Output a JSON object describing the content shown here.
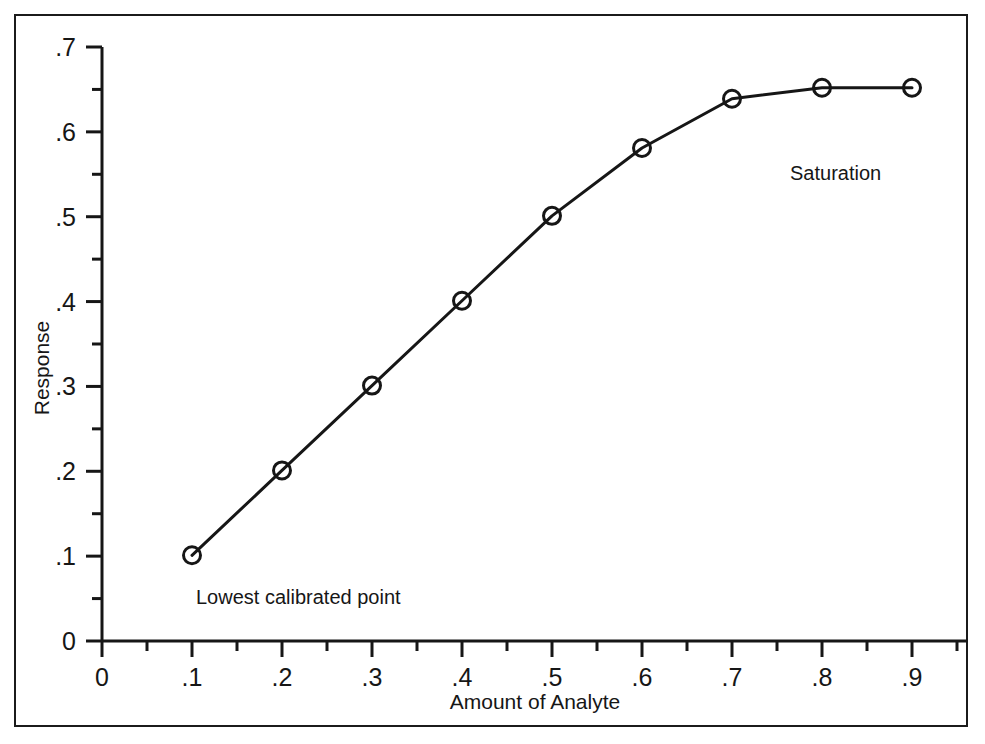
{
  "figure": {
    "background_color": "#ffffff",
    "frame_color": "#1b1b1b",
    "ink_color": "#161616"
  },
  "chart_data": {
    "type": "line",
    "title": "",
    "subtitle": "",
    "xlabel": "Amount of Analyte",
    "ylabel": "Response",
    "xlim": [
      0,
      0.96
    ],
    "ylim": [
      0,
      0.7
    ],
    "grid": false,
    "legend": false,
    "legend_position": "none",
    "marker": "open-circle",
    "line_color": "#161616",
    "x": [
      0.1,
      0.2,
      0.3,
      0.4,
      0.5,
      0.6,
      0.7,
      0.8,
      0.9
    ],
    "values": [
      0.101,
      0.201,
      0.301,
      0.401,
      0.501,
      0.581,
      0.639,
      0.652,
      0.652
    ],
    "series": [
      {
        "name": "Calibration curve",
        "x": [
          0.1,
          0.2,
          0.3,
          0.4,
          0.5,
          0.6,
          0.7,
          0.8,
          0.9
        ],
        "values": [
          0.101,
          0.201,
          0.301,
          0.401,
          0.501,
          0.581,
          0.639,
          0.652,
          0.652
        ]
      }
    ],
    "xticks": [
      0,
      0.1,
      0.2,
      0.3,
      0.4,
      0.5,
      0.6,
      0.7,
      0.8,
      0.9
    ],
    "xticklabels": [
      "0",
      ".1",
      ".2",
      ".3",
      ".4",
      ".5",
      ".6",
      ".7",
      ".8",
      ".9"
    ],
    "xminorticks": [
      0.05,
      0.15,
      0.25,
      0.35,
      0.45,
      0.55,
      0.65,
      0.75,
      0.85,
      0.95
    ],
    "yticks": [
      0,
      0.1,
      0.2,
      0.3,
      0.4,
      0.5,
      0.6,
      0.7
    ],
    "yticklabels": [
      "0",
      ".1",
      ".2",
      ".3",
      ".4",
      ".5",
      ".6",
      ".7"
    ],
    "yminorticks": [
      0.05,
      0.15,
      0.25,
      0.35,
      0.45,
      0.55,
      0.65
    ],
    "annotations": [
      {
        "text": "Lowest calibrated point",
        "x": 0.105,
        "y": 0.052
      },
      {
        "text": "Saturation",
        "x": 0.765,
        "y": 0.551
      }
    ]
  }
}
